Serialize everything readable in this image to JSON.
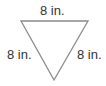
{
  "figure": {
    "shape": "inverted equilateral triangle",
    "stroke_color": "#888888",
    "labels": {
      "top": "8 in.",
      "left": "8 in.",
      "right": "8 in."
    }
  }
}
